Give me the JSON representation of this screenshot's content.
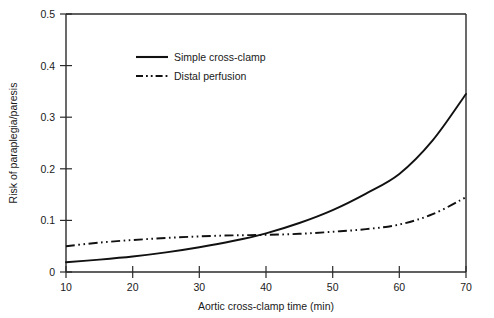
{
  "chart_data": {
    "type": "line",
    "title": "",
    "xlabel": "Aortic cross-clamp time (min)",
    "ylabel": "Risk of paraplegia/paresis",
    "xlim": [
      10,
      70
    ],
    "ylim": [
      0,
      0.5
    ],
    "xticks": [
      "10",
      "20",
      "30",
      "40",
      "50",
      "60",
      "70"
    ],
    "yticks": [
      "0",
      "0.1",
      "0.2",
      "0.3",
      "0.4",
      "0.5"
    ],
    "xtick_values": [
      10,
      20,
      30,
      40,
      50,
      60,
      70
    ],
    "ytick_values": [
      0,
      0.1,
      0.2,
      0.3,
      0.4,
      0.5
    ],
    "grid": false,
    "legend_position": "upper-left-inset",
    "x": [
      10,
      15,
      20,
      25,
      30,
      35,
      40,
      45,
      50,
      55,
      60,
      65,
      70
    ],
    "series": [
      {
        "name": "Simple cross-clamp",
        "style": "solid",
        "color": "#111111",
        "values": [
          0.019,
          0.024,
          0.03,
          0.038,
          0.048,
          0.06,
          0.075,
          0.095,
          0.12,
          0.152,
          0.19,
          0.255,
          0.345
        ]
      },
      {
        "name": "Distal perfusion",
        "style": "dash-dot",
        "color": "#111111",
        "values": [
          0.05,
          0.057,
          0.062,
          0.066,
          0.069,
          0.071,
          0.072,
          0.074,
          0.078,
          0.083,
          0.092,
          0.112,
          0.145
        ]
      }
    ],
    "annotations": [
      {
        "text": "curves cross near 38 min at risk 0.072"
      }
    ]
  },
  "legend": {
    "items": [
      {
        "label": "Simple cross-clamp",
        "key": "solid-line-key"
      },
      {
        "label": "Distal perfusion",
        "key": "dash-dot-line-key"
      }
    ]
  },
  "axes": {
    "x_title": "Aortic cross-clamp time (min)",
    "y_title": "Risk of paraplegia/paresis"
  }
}
